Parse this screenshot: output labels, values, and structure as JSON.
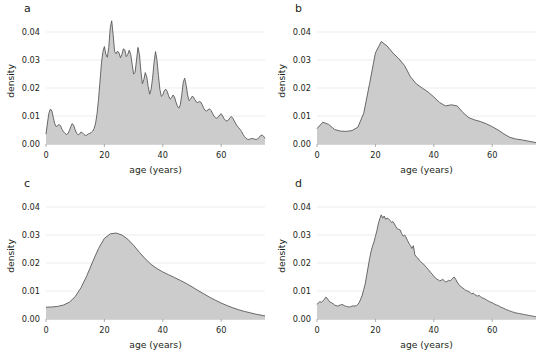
{
  "figure": {
    "panels": [
      {
        "id": "a",
        "label": "a"
      },
      {
        "id": "b",
        "label": "b"
      },
      {
        "id": "c",
        "label": "c"
      },
      {
        "id": "d",
        "label": "d"
      }
    ],
    "axis": {
      "xlabel": "age (years)",
      "ylabel": "density",
      "xticks": [
        "0",
        "20",
        "40",
        "60"
      ],
      "xtick_values": [
        0,
        20,
        40,
        60
      ],
      "yticks": [
        "0.00",
        "0.01",
        "0.02",
        "0.03",
        "0.04"
      ],
      "ytick_values": [
        0.0,
        0.01,
        0.02,
        0.03,
        0.04
      ],
      "xlim": [
        0,
        75
      ],
      "ylim": [
        0,
        0.045
      ]
    },
    "colors": {
      "fill": "#cccccc",
      "line": "#58595b",
      "grid": "#e8e8ea",
      "text": "#231f20",
      "background": "#ffffff"
    }
  },
  "chart_data": [
    {
      "type": "area",
      "panel": "a",
      "title": "a",
      "xlabel": "age (years)",
      "ylabel": "density",
      "xlim": [
        0,
        75
      ],
      "ylim": [
        0,
        0.045
      ],
      "grid": true,
      "legend": null,
      "description": "Kernel density estimate of age with very small bandwidth; highly jagged / undersmoothed",
      "x": [
        0,
        0.5,
        1,
        1.5,
        2,
        2.5,
        3,
        3.5,
        4,
        4.5,
        5,
        5.5,
        6,
        6.5,
        7,
        7.5,
        8,
        8.5,
        9,
        9.5,
        10,
        10.5,
        11,
        11.5,
        12,
        12.5,
        13,
        13.5,
        14,
        14.5,
        15,
        15.5,
        16,
        16.5,
        17,
        17.5,
        18,
        18.5,
        19,
        19.5,
        20,
        20.5,
        21,
        21.5,
        22,
        22.5,
        23,
        23.5,
        24,
        24.5,
        25,
        25.5,
        26,
        26.5,
        27,
        27.5,
        28,
        28.5,
        29,
        29.5,
        30,
        30.5,
        31,
        31.5,
        32,
        32.5,
        33,
        33.5,
        34,
        34.5,
        35,
        35.5,
        36,
        36.5,
        37,
        37.5,
        38,
        38.5,
        39,
        39.5,
        40,
        40.5,
        41,
        41.5,
        42,
        42.5,
        43,
        43.5,
        44,
        44.5,
        45,
        45.5,
        46,
        46.5,
        47,
        47.5,
        48,
        48.5,
        49,
        49.5,
        50,
        50.5,
        51,
        51.5,
        52,
        52.5,
        53,
        53.5,
        54,
        54.5,
        55,
        55.5,
        56,
        56.5,
        57,
        57.5,
        58,
        58.5,
        59,
        59.5,
        60,
        60.5,
        61,
        61.5,
        62,
        62.5,
        63,
        63.5,
        64,
        64.5,
        65,
        65.5,
        66,
        66.5,
        67,
        67.5,
        68,
        68.5,
        69,
        69.5,
        70,
        70.5,
        71,
        71.5,
        72,
        72.5,
        73,
        73.5,
        74,
        74.5,
        75
      ],
      "y": [
        0.0035,
        0.0075,
        0.011,
        0.0125,
        0.0118,
        0.0095,
        0.0072,
        0.0062,
        0.0066,
        0.007,
        0.0064,
        0.0052,
        0.0044,
        0.0038,
        0.0034,
        0.0037,
        0.0048,
        0.0062,
        0.0073,
        0.0066,
        0.005,
        0.0038,
        0.0033,
        0.0036,
        0.0043,
        0.004,
        0.0034,
        0.003,
        0.0032,
        0.0036,
        0.0038,
        0.0041,
        0.0046,
        0.0056,
        0.0075,
        0.011,
        0.016,
        0.0225,
        0.029,
        0.033,
        0.0348,
        0.032,
        0.031,
        0.0345,
        0.0415,
        0.044,
        0.039,
        0.033,
        0.0322,
        0.0332,
        0.0325,
        0.0308,
        0.032,
        0.034,
        0.0336,
        0.0312,
        0.032,
        0.0335,
        0.032,
        0.0285,
        0.025,
        0.0255,
        0.03,
        0.0345,
        0.032,
        0.026,
        0.0215,
        0.023,
        0.0255,
        0.024,
        0.0205,
        0.0178,
        0.0195,
        0.0235,
        0.029,
        0.033,
        0.03,
        0.0245,
        0.0195,
        0.017,
        0.0175,
        0.019,
        0.0196,
        0.0188,
        0.0172,
        0.016,
        0.0165,
        0.0175,
        0.0168,
        0.015,
        0.0135,
        0.0128,
        0.014,
        0.0175,
        0.022,
        0.0235,
        0.021,
        0.0175,
        0.0155,
        0.016,
        0.017,
        0.0168,
        0.0158,
        0.015,
        0.0148,
        0.0152,
        0.015,
        0.014,
        0.0128,
        0.012,
        0.0118,
        0.0122,
        0.0126,
        0.012,
        0.011,
        0.01,
        0.0094,
        0.0092,
        0.0096,
        0.0104,
        0.0108,
        0.01,
        0.009,
        0.0084,
        0.0082,
        0.0086,
        0.0094,
        0.0098,
        0.0092,
        0.0082,
        0.0072,
        0.0064,
        0.0058,
        0.0052,
        0.0044,
        0.0034,
        0.0026,
        0.002,
        0.0017,
        0.0016,
        0.0018,
        0.002,
        0.0019,
        0.0017,
        0.0016,
        0.0018,
        0.0024,
        0.003,
        0.0032,
        0.0028,
        0.002,
        0.0014,
        0.0012,
        0.0011,
        0.001,
        0.0009
      ]
    },
    {
      "type": "area",
      "panel": "b",
      "title": "b",
      "xlabel": "age (years)",
      "ylabel": "density",
      "xlim": [
        0,
        75
      ],
      "ylim": [
        0,
        0.045
      ],
      "grid": true,
      "legend": null,
      "description": "Kernel density estimate of age with large bandwidth; smooth with main peak near age 22 and a secondary shoulder near age 46",
      "x": [
        0,
        2,
        4,
        6,
        8,
        10,
        12,
        14,
        16,
        18,
        20,
        22,
        24,
        26,
        28,
        30,
        32,
        34,
        36,
        38,
        40,
        42,
        44,
        46,
        48,
        50,
        52,
        54,
        56,
        58,
        60,
        62,
        64,
        66,
        68,
        70,
        72,
        74,
        75
      ],
      "y": [
        0.0055,
        0.0078,
        0.007,
        0.0052,
        0.0046,
        0.0045,
        0.0048,
        0.006,
        0.011,
        0.0215,
        0.0325,
        0.0366,
        0.035,
        0.0325,
        0.0305,
        0.028,
        0.024,
        0.0215,
        0.02,
        0.0186,
        0.0168,
        0.0148,
        0.0136,
        0.014,
        0.0136,
        0.0112,
        0.0094,
        0.0086,
        0.008,
        0.0072,
        0.0062,
        0.005,
        0.0036,
        0.0024,
        0.0018,
        0.0015,
        0.0011,
        0.0007,
        0.0005
      ]
    },
    {
      "type": "area",
      "panel": "c",
      "title": "c",
      "xlabel": "age (years)",
      "ylabel": "density",
      "xlim": [
        0,
        75
      ],
      "ylim": [
        0,
        0.045
      ],
      "grid": true,
      "legend": null,
      "description": "Kernel density estimate of age with very large bandwidth; oversmoothed unimodal curve peaking near age 24 at about 0.0307",
      "x": [
        0,
        2,
        4,
        6,
        8,
        10,
        12,
        14,
        16,
        18,
        20,
        22,
        24,
        26,
        28,
        30,
        32,
        34,
        36,
        38,
        40,
        42,
        44,
        46,
        48,
        50,
        52,
        54,
        56,
        58,
        60,
        62,
        64,
        66,
        68,
        70,
        72,
        74,
        75
      ],
      "y": [
        0.0042,
        0.0043,
        0.0045,
        0.005,
        0.006,
        0.008,
        0.0112,
        0.0155,
        0.0205,
        0.0252,
        0.0288,
        0.0304,
        0.0307,
        0.03,
        0.0285,
        0.0263,
        0.0238,
        0.0215,
        0.0195,
        0.018,
        0.0168,
        0.0158,
        0.0148,
        0.0138,
        0.0127,
        0.0115,
        0.0102,
        0.009,
        0.0078,
        0.0067,
        0.0057,
        0.0048,
        0.004,
        0.0033,
        0.0027,
        0.0022,
        0.0017,
        0.0013,
        0.0011
      ]
    },
    {
      "type": "area",
      "panel": "d",
      "title": "d",
      "xlabel": "age (years)",
      "ylabel": "density",
      "xlim": [
        0,
        75
      ],
      "ylim": [
        0,
        0.045
      ],
      "grid": true,
      "legend": null,
      "description": "Kernel density estimate of age with intermediate/small bandwidth; noisy but shows main peak near age 22 at about 0.0375 and secondary bumps near ages 3, 33 and 47",
      "x": [
        0,
        0.5,
        1,
        1.5,
        2,
        2.5,
        3,
        3.5,
        4,
        4.5,
        5,
        5.5,
        6,
        6.5,
        7,
        7.5,
        8,
        8.5,
        9,
        9.5,
        10,
        10.5,
        11,
        11.5,
        12,
        12.5,
        13,
        13.5,
        14,
        14.5,
        15,
        15.5,
        16,
        16.5,
        17,
        17.5,
        18,
        18.5,
        19,
        19.5,
        20,
        20.5,
        21,
        21.5,
        22,
        22.5,
        23,
        23.5,
        24,
        24.5,
        25,
        25.5,
        26,
        26.5,
        27,
        27.5,
        28,
        28.5,
        29,
        29.5,
        30,
        30.5,
        31,
        31.5,
        32,
        32.5,
        33,
        33.5,
        34,
        34.5,
        35,
        35.5,
        36,
        36.5,
        37,
        37.5,
        38,
        38.5,
        39,
        39.5,
        40,
        40.5,
        41,
        41.5,
        42,
        42.5,
        43,
        43.5,
        44,
        44.5,
        45,
        45.5,
        46,
        46.5,
        47,
        47.5,
        48,
        48.5,
        49,
        49.5,
        50,
        50.5,
        51,
        51.5,
        52,
        52.5,
        53,
        53.5,
        54,
        54.5,
        55,
        55.5,
        56,
        56.5,
        57,
        57.5,
        58,
        58.5,
        59,
        59.5,
        60,
        60.5,
        61,
        61.5,
        62,
        62.5,
        63,
        63.5,
        64,
        64.5,
        65,
        65.5,
        66,
        66.5,
        67,
        67.5,
        68,
        68.5,
        69,
        69.5,
        70,
        70.5,
        71,
        71.5,
        72,
        72.5,
        73,
        73.5,
        74,
        74.5,
        75
      ],
      "y": [
        0.0052,
        0.0058,
        0.0062,
        0.006,
        0.0064,
        0.007,
        0.0078,
        0.0074,
        0.0066,
        0.006,
        0.0058,
        0.0055,
        0.005,
        0.0048,
        0.0046,
        0.0048,
        0.005,
        0.0052,
        0.005,
        0.0047,
        0.0045,
        0.0044,
        0.0043,
        0.0044,
        0.0046,
        0.0047,
        0.0046,
        0.0048,
        0.0052,
        0.006,
        0.0072,
        0.0085,
        0.0105,
        0.0125,
        0.0155,
        0.0185,
        0.0215,
        0.024,
        0.026,
        0.0275,
        0.0295,
        0.0315,
        0.034,
        0.0358,
        0.0372,
        0.036,
        0.0368,
        0.0356,
        0.036,
        0.0358,
        0.0352,
        0.0345,
        0.0348,
        0.034,
        0.033,
        0.0322,
        0.032,
        0.0318,
        0.0305,
        0.0296,
        0.03,
        0.0292,
        0.028,
        0.027,
        0.0262,
        0.0252,
        0.0262,
        0.023,
        0.0222,
        0.0218,
        0.021,
        0.0205,
        0.02,
        0.0196,
        0.019,
        0.0184,
        0.0178,
        0.0172,
        0.0165,
        0.016,
        0.0152,
        0.0148,
        0.0142,
        0.014,
        0.0136,
        0.0138,
        0.0142,
        0.0138,
        0.0132,
        0.0134,
        0.0138,
        0.0136,
        0.014,
        0.0146,
        0.015,
        0.0142,
        0.0132,
        0.0124,
        0.0118,
        0.0114,
        0.011,
        0.0106,
        0.0102,
        0.01,
        0.0098,
        0.0094,
        0.009,
        0.0092,
        0.0088,
        0.0084,
        0.0082,
        0.0084,
        0.008,
        0.0076,
        0.0074,
        0.0072,
        0.0068,
        0.0066,
        0.0062,
        0.006,
        0.0058,
        0.0055,
        0.0052,
        0.005,
        0.0048,
        0.0045,
        0.0042,
        0.004,
        0.0038,
        0.0035,
        0.0033,
        0.0031,
        0.0029,
        0.0027,
        0.0025,
        0.0024,
        0.0022,
        0.0021,
        0.002,
        0.0019,
        0.0018,
        0.0017,
        0.0016,
        0.0015,
        0.0014,
        0.0013,
        0.0012,
        0.0011,
        0.001,
        0.0009,
        0.0008,
        0.0007
      ]
    }
  ]
}
